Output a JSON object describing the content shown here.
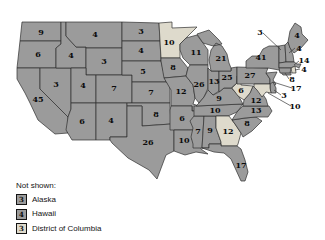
{
  "colors": {
    "state": "#9b9b9b",
    "highlight": "#dedacc",
    "border": "#2f2f2f",
    "background": "#ffffff",
    "label_text": "#0c0c0c"
  },
  "map": {
    "description": "United States electoral vote map; shaded light states highlighted",
    "states": [
      {
        "name": "Washington",
        "abbr": "WA",
        "votes": "9",
        "highlighted": false
      },
      {
        "name": "Oregon",
        "abbr": "OR",
        "votes": "6",
        "highlighted": false
      },
      {
        "name": "California",
        "abbr": "CA",
        "votes": "45",
        "highlighted": false
      },
      {
        "name": "Nevada",
        "abbr": "NV",
        "votes": "3",
        "highlighted": false
      },
      {
        "name": "Idaho",
        "abbr": "ID",
        "votes": "4",
        "highlighted": false
      },
      {
        "name": "Montana",
        "abbr": "MT",
        "votes": "4",
        "highlighted": false
      },
      {
        "name": "Wyoming",
        "abbr": "WY",
        "votes": "3",
        "highlighted": false
      },
      {
        "name": "Utah",
        "abbr": "UT",
        "votes": "4",
        "highlighted": false
      },
      {
        "name": "Colorado",
        "abbr": "CO",
        "votes": "7",
        "highlighted": false
      },
      {
        "name": "Arizona",
        "abbr": "AZ",
        "votes": "6",
        "highlighted": false
      },
      {
        "name": "New Mexico",
        "abbr": "NM",
        "votes": "4",
        "highlighted": false
      },
      {
        "name": "North Dakota",
        "abbr": "ND",
        "votes": "3",
        "highlighted": false
      },
      {
        "name": "South Dakota",
        "abbr": "SD",
        "votes": "4",
        "highlighted": false
      },
      {
        "name": "Nebraska",
        "abbr": "NE",
        "votes": "5",
        "highlighted": false
      },
      {
        "name": "Kansas",
        "abbr": "KS",
        "votes": "7",
        "highlighted": false
      },
      {
        "name": "Oklahoma",
        "abbr": "OK",
        "votes": "8",
        "highlighted": false
      },
      {
        "name": "Texas",
        "abbr": "TX",
        "votes": "26",
        "highlighted": false
      },
      {
        "name": "Minnesota",
        "abbr": "MN",
        "votes": "10",
        "highlighted": true
      },
      {
        "name": "Iowa",
        "abbr": "IA",
        "votes": "8",
        "highlighted": false
      },
      {
        "name": "Missouri",
        "abbr": "MO",
        "votes": "12",
        "highlighted": false
      },
      {
        "name": "Arkansas",
        "abbr": "AR",
        "votes": "6",
        "highlighted": false
      },
      {
        "name": "Louisiana",
        "abbr": "LA",
        "votes": "10",
        "highlighted": false
      },
      {
        "name": "Wisconsin",
        "abbr": "WI",
        "votes": "11",
        "highlighted": false
      },
      {
        "name": "Illinois",
        "abbr": "IL",
        "votes": "26",
        "highlighted": false
      },
      {
        "name": "Mississippi",
        "abbr": "MS",
        "votes": "7",
        "highlighted": false
      },
      {
        "name": "Alabama",
        "abbr": "AL",
        "votes": "9",
        "highlighted": false
      },
      {
        "name": "Tennessee",
        "abbr": "TN",
        "votes": "10",
        "highlighted": false
      },
      {
        "name": "Kentucky",
        "abbr": "KY",
        "votes": "9",
        "highlighted": false
      },
      {
        "name": "Indiana",
        "abbr": "IN",
        "votes": "13",
        "highlighted": false
      },
      {
        "name": "Ohio",
        "abbr": "OH",
        "votes": "25",
        "highlighted": false
      },
      {
        "name": "Michigan",
        "abbr": "MI",
        "votes": "21",
        "highlighted": false
      },
      {
        "name": "Georgia",
        "abbr": "GA",
        "votes": "12",
        "highlighted": true
      },
      {
        "name": "Florida",
        "abbr": "FL",
        "votes": "17",
        "highlighted": false
      },
      {
        "name": "South Carolina",
        "abbr": "SC",
        "votes": "8",
        "highlighted": false
      },
      {
        "name": "North Carolina",
        "abbr": "NC",
        "votes": "13",
        "highlighted": false
      },
      {
        "name": "Virginia",
        "abbr": "VA",
        "votes": "12",
        "highlighted": false
      },
      {
        "name": "West Virginia",
        "abbr": "WV",
        "votes": "6",
        "highlighted": true
      },
      {
        "name": "Pennsylvania",
        "abbr": "PA",
        "votes": "27",
        "highlighted": false
      },
      {
        "name": "New York",
        "abbr": "NY",
        "votes": "41",
        "highlighted": false
      },
      {
        "name": "Vermont",
        "abbr": "VT",
        "votes": "3",
        "highlighted": false
      },
      {
        "name": "New Hampshire",
        "abbr": "NH",
        "votes": "4",
        "highlighted": false
      },
      {
        "name": "Maine",
        "abbr": "ME",
        "votes": "4",
        "highlighted": false
      },
      {
        "name": "Massachusetts",
        "abbr": "MA",
        "votes": "14",
        "highlighted": false
      },
      {
        "name": "Rhode Island",
        "abbr": "RI",
        "votes": "4",
        "highlighted": true
      },
      {
        "name": "Connecticut",
        "abbr": "CT",
        "votes": "8",
        "highlighted": false
      },
      {
        "name": "New Jersey",
        "abbr": "NJ",
        "votes": "17",
        "highlighted": false
      },
      {
        "name": "Delaware",
        "abbr": "DE",
        "votes": "3",
        "highlighted": false
      },
      {
        "name": "Maryland",
        "abbr": "MD",
        "votes": "10",
        "highlighted": true
      }
    ]
  },
  "legend": {
    "title": "Not shown:",
    "items": [
      {
        "votes": "3",
        "name": "Alaska",
        "highlighted": false
      },
      {
        "votes": "4",
        "name": "Hawaii",
        "highlighted": false
      },
      {
        "votes": "3",
        "name": "District of Columbia",
        "highlighted": true
      }
    ]
  }
}
